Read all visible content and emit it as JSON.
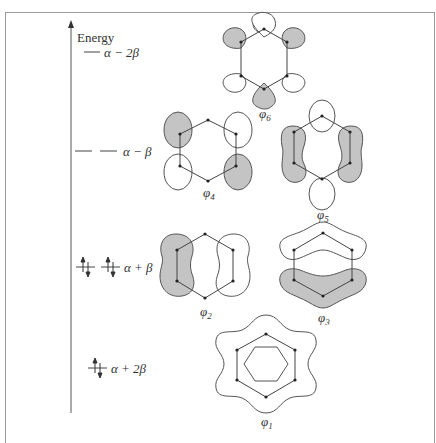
{
  "header_fragment": "ng given below",
  "axis": {
    "label": "Energy"
  },
  "levels": [
    {
      "name": "antibonding-high",
      "label": "α − 2β",
      "degeneracy": 1,
      "electrons": 0
    },
    {
      "name": "antibonding",
      "label": "α − β",
      "degeneracy": 2,
      "electrons": 0
    },
    {
      "name": "bonding",
      "label": "α + β",
      "degeneracy": 2,
      "electrons": 4
    },
    {
      "name": "bonding-low",
      "label": "α + 2β",
      "degeneracy": 1,
      "electrons": 2
    }
  ],
  "orbitals": [
    {
      "id": "phi6",
      "label": "φ",
      "sub": "6"
    },
    {
      "id": "phi4",
      "label": "φ",
      "sub": "4"
    },
    {
      "id": "phi5",
      "label": "φ",
      "sub": "5"
    },
    {
      "id": "phi2",
      "label": "φ",
      "sub": "2"
    },
    {
      "id": "phi3",
      "label": "φ",
      "sub": "3"
    },
    {
      "id": "phi1",
      "label": "φ",
      "sub": "1"
    }
  ],
  "colors": {
    "shaded_lobe": "#c4c4c4",
    "line": "#444444",
    "frame": "#9a9a9a"
  }
}
